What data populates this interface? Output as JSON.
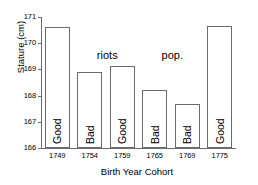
{
  "chart_data": {
    "type": "bar",
    "title": "",
    "xlabel": "Birth Year Cohort",
    "ylabel": "Stature (cm)",
    "categories": [
      "1749",
      "1754",
      "1759",
      "1765",
      "1769",
      "1775"
    ],
    "values": [
      170.62,
      168.9,
      169.13,
      168.21,
      167.68,
      170.66
    ],
    "bar_labels": [
      "Good",
      "Bad",
      "Good",
      "Bad",
      "Bad",
      "Good"
    ],
    "ylim": [
      166,
      171
    ],
    "yticks": [
      "166",
      "167",
      "168",
      "169",
      "170",
      "171"
    ],
    "grid": false,
    "legend": "none",
    "annotations": [
      {
        "text": "riots",
        "x": "1759",
        "y": 169.5
      },
      {
        "text": "pop.",
        "x": "1769",
        "y": 169.5
      }
    ]
  },
  "style": {
    "bar_edge_color": "#6b6b6b",
    "bar_fill_color": "#ffffff",
    "axis_color": "#6e6e6e",
    "text_color": "#000000",
    "background": "#ffffff"
  }
}
